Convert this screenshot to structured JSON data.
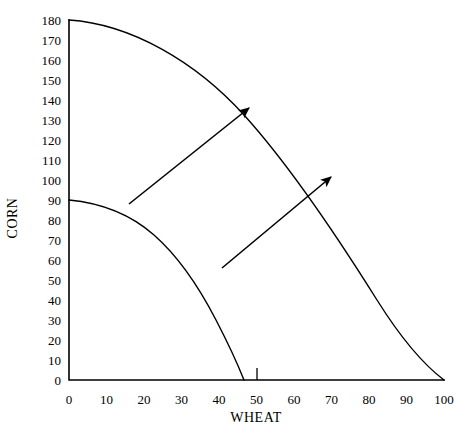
{
  "chart_data": {
    "type": "line",
    "title": "",
    "top_caption": "",
    "xlabel": "WHEAT",
    "ylabel": "CORN",
    "xlim": [
      0,
      100
    ],
    "ylim": [
      0,
      180
    ],
    "grid": false,
    "legend": "none",
    "x_ticks": [
      0,
      10,
      20,
      30,
      40,
      50,
      60,
      70,
      80,
      90,
      100
    ],
    "x_tick_labels": [
      "0",
      "10",
      "20",
      "30",
      "40",
      "50",
      "60",
      "70",
      "80",
      "90",
      "100"
    ],
    "y_ticks": [
      0,
      10,
      20,
      30,
      40,
      50,
      60,
      70,
      80,
      90,
      100,
      110,
      120,
      130,
      140,
      150,
      160,
      170,
      180
    ],
    "y_tick_labels": [
      "0",
      "10",
      "20",
      "30",
      "40",
      "50",
      "60",
      "70",
      "80",
      "90",
      "100",
      "110",
      "120",
      "130",
      "140",
      "150",
      "160",
      "170",
      "180"
    ],
    "axis_tick_marks_x": [
      50
    ],
    "series": [
      {
        "name": "outer-ppf",
        "type": "curve",
        "note": "expanded production possibilities frontier, concave to origin",
        "x_intercept": 100,
        "y_intercept": 180,
        "points": [
          {
            "x": 0,
            "y": 180
          },
          {
            "x": 10,
            "y": 179
          },
          {
            "x": 20,
            "y": 175
          },
          {
            "x": 30,
            "y": 169
          },
          {
            "x": 40,
            "y": 160
          },
          {
            "x": 50,
            "y": 148
          },
          {
            "x": 60,
            "y": 133
          },
          {
            "x": 70,
            "y": 114
          },
          {
            "x": 80,
            "y": 92
          },
          {
            "x": 90,
            "y": 62
          },
          {
            "x": 100,
            "y": 0
          }
        ]
      },
      {
        "name": "inner-ppf",
        "type": "curve",
        "note": "original production possibilities frontier, concave to origin",
        "x_intercept": 50,
        "y_intercept": 90,
        "points": [
          {
            "x": 0,
            "y": 90
          },
          {
            "x": 5,
            "y": 89
          },
          {
            "x": 10,
            "y": 88
          },
          {
            "x": 15,
            "y": 85
          },
          {
            "x": 20,
            "y": 81
          },
          {
            "x": 25,
            "y": 76
          },
          {
            "x": 30,
            "y": 70
          },
          {
            "x": 35,
            "y": 63
          },
          {
            "x": 40,
            "y": 55
          },
          {
            "x": 45,
            "y": 42
          },
          {
            "x": 50,
            "y": 0
          }
        ]
      }
    ],
    "annotations": [
      {
        "name": "upper-growth-arrow",
        "type": "arrow",
        "from": {
          "x": 16,
          "y": 88
        },
        "to": {
          "x": 48,
          "y": 136
        }
      },
      {
        "name": "lower-growth-arrow",
        "type": "arrow",
        "from": {
          "x": 41,
          "y": 56
        },
        "to": {
          "x": 70,
          "y": 102
        }
      }
    ]
  }
}
